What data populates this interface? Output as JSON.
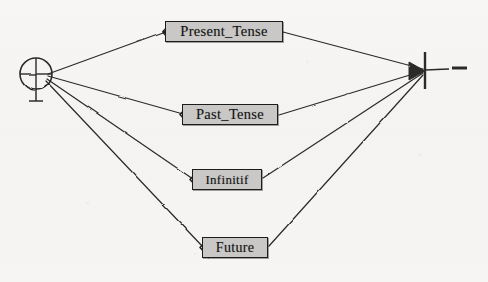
{
  "diagram": {
    "type": "finite-state-transition-network",
    "background_color": "#f6f5f3",
    "ink_color": "#2a2a2a",
    "node_fill_color": "#c9c8c6",
    "node_border_color": "#1c1c1c",
    "start_node": {
      "name": "start-node",
      "symbol": "circled-cross",
      "x": 36,
      "y": 74
    },
    "end_node": {
      "name": "end-node",
      "symbol": "barbed-terminal",
      "x": 425,
      "y": 70,
      "tail_end_x": 466
    },
    "nodes": [
      {
        "id": "present-tense",
        "label": "Present_Tense",
        "x": 165,
        "y": 21,
        "width": 118,
        "height": 21
      },
      {
        "id": "past-tense",
        "label": "Past_Tense",
        "x": 182,
        "y": 104,
        "width": 96,
        "height": 21
      },
      {
        "id": "infinitif",
        "label": "Infinitif",
        "x": 192,
        "y": 169,
        "width": 70,
        "height": 21
      },
      {
        "id": "future",
        "label": "Future",
        "x": 202,
        "y": 237,
        "width": 66,
        "height": 21
      }
    ],
    "edges": [
      {
        "id": "start-to-present",
        "from": "start-node",
        "to": "present-tense"
      },
      {
        "id": "start-to-past",
        "from": "start-node",
        "to": "past-tense"
      },
      {
        "id": "start-to-infinitif",
        "from": "start-node",
        "to": "infinitif"
      },
      {
        "id": "start-to-future",
        "from": "start-node",
        "to": "future"
      },
      {
        "id": "present-to-end",
        "from": "present-tense",
        "to": "end-node"
      },
      {
        "id": "past-to-end",
        "from": "past-tense",
        "to": "end-node"
      },
      {
        "id": "infinitif-to-end",
        "from": "infinitif",
        "to": "end-node"
      },
      {
        "id": "future-to-end",
        "from": "future",
        "to": "end-node"
      }
    ]
  }
}
